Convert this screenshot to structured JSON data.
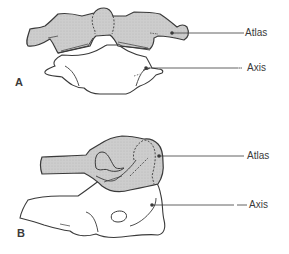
{
  "figure": {
    "colors": {
      "outline": "#3a3a3a",
      "atlas_fill": "#c8c8c8",
      "axis_fill": "#ffffff",
      "background": "#ffffff"
    }
  },
  "panels": [
    {
      "letter": "A",
      "labels": [
        {
          "text": "Atlas"
        },
        {
          "text": "Axis"
        }
      ]
    },
    {
      "letter": "B",
      "labels": [
        {
          "text": "Atlas"
        },
        {
          "text": "Axis"
        }
      ]
    }
  ]
}
